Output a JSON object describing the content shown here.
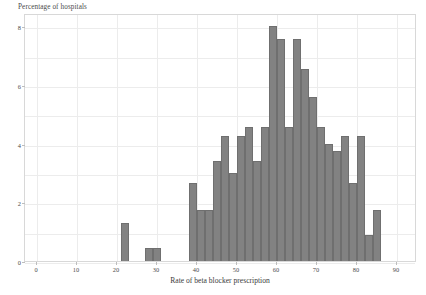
{
  "chart_data": {
    "type": "bar",
    "title": "",
    "xlabel": "Rate of beta blocker prescription",
    "ylabel": "Percentage of hospitals",
    "xlim": [
      -3,
      95
    ],
    "ylim": [
      0,
      8.45
    ],
    "grid": true,
    "legend": null,
    "bin_width": 2,
    "bar_color": "#828282",
    "bar_edge_color": "#6f6f6f",
    "grid_color": "#ececec",
    "frame_color": "#d8d8d8",
    "xticks": [
      0,
      10,
      20,
      30,
      40,
      50,
      60,
      70,
      80,
      90
    ],
    "xtick_labels": [
      "0",
      "10",
      "20",
      "30",
      "40",
      "50",
      "60",
      "70",
      "80",
      "90"
    ],
    "yticks": [
      0,
      2,
      4,
      6,
      8
    ],
    "ytick_labels": [
      "0",
      "2",
      "4",
      "6",
      "8"
    ],
    "bins": [
      {
        "x0": 21,
        "x1": 23,
        "value": 1.3
      },
      {
        "x0": 27,
        "x1": 29,
        "value": 0.45
      },
      {
        "x0": 29,
        "x1": 31,
        "value": 0.45
      },
      {
        "x0": 38,
        "x1": 40,
        "value": 2.65
      },
      {
        "x0": 40,
        "x1": 42,
        "value": 1.75
      },
      {
        "x0": 42,
        "x1": 44,
        "value": 1.75
      },
      {
        "x0": 44,
        "x1": 46,
        "value": 3.4
      },
      {
        "x0": 46,
        "x1": 48,
        "value": 4.25
      },
      {
        "x0": 48,
        "x1": 50,
        "value": 3.0
      },
      {
        "x0": 50,
        "x1": 52,
        "value": 4.25
      },
      {
        "x0": 52,
        "x1": 54,
        "value": 4.55
      },
      {
        "x0": 54,
        "x1": 56,
        "value": 3.4
      },
      {
        "x0": 56,
        "x1": 58,
        "value": 4.55
      },
      {
        "x0": 58,
        "x1": 60,
        "value": 8.0
      },
      {
        "x0": 60,
        "x1": 62,
        "value": 7.55
      },
      {
        "x0": 62,
        "x1": 64,
        "value": 4.55
      },
      {
        "x0": 64,
        "x1": 66,
        "value": 7.55
      },
      {
        "x0": 66,
        "x1": 68,
        "value": 6.55
      },
      {
        "x0": 68,
        "x1": 70,
        "value": 5.6
      },
      {
        "x0": 70,
        "x1": 72,
        "value": 4.55
      },
      {
        "x0": 72,
        "x1": 74,
        "value": 4.0
      },
      {
        "x0": 74,
        "x1": 76,
        "value": 3.75
      },
      {
        "x0": 76,
        "x1": 78,
        "value": 4.25
      },
      {
        "x0": 78,
        "x1": 80,
        "value": 2.65
      },
      {
        "x0": 80,
        "x1": 82,
        "value": 4.25
      },
      {
        "x0": 82,
        "x1": 84,
        "value": 0.9
      },
      {
        "x0": 84,
        "x1": 86,
        "value": 1.75
      }
    ]
  }
}
